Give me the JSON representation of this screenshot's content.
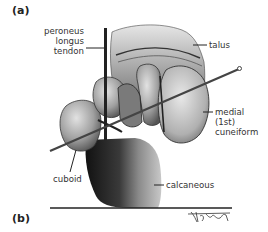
{
  "figure": {
    "panel_a": "(a)",
    "panel_b": "(b)",
    "labels": {
      "peroneus": [
        "peroneus",
        "longus",
        "tendon"
      ],
      "talus": "talus",
      "medial_cuneiform": [
        "medial",
        "(1st)",
        "cuneiform"
      ],
      "cuboid": "cuboid",
      "calcaneous": "calcaneous"
    },
    "signature": "Vicky Earle",
    "colors": {
      "ink": "#222222",
      "bone_light": "#d4d4d4",
      "bone_mid": "#9a9a9a",
      "bone_dark": "#2a2a2a",
      "background": "#ffffff"
    }
  }
}
